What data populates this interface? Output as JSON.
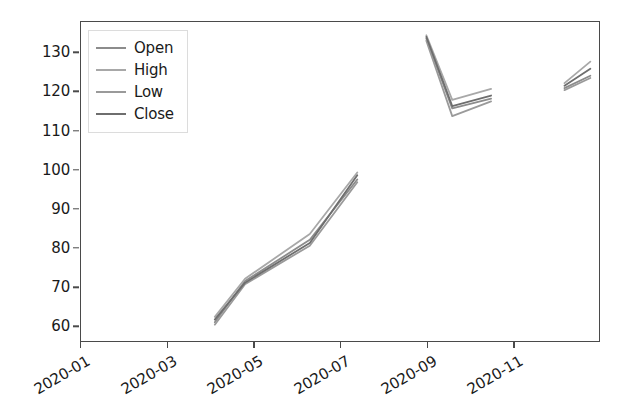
{
  "chart_data": {
    "type": "line",
    "title": "",
    "xlabel": "",
    "ylabel": "",
    "xlim": [
      "2020-01",
      "2020-13"
    ],
    "ylim": [
      56,
      138
    ],
    "grid": false,
    "legend_position": "upper left",
    "y_ticks": [
      60,
      70,
      80,
      90,
      100,
      110,
      120,
      130
    ],
    "x_ticks": [
      "2020-01",
      "2020-03",
      "2020-05",
      "2020-07",
      "2020-09",
      "2020-11"
    ],
    "x_tick_rotation": -30,
    "colors": {
      "open": "#8c8c8c",
      "high": "#a8a8a8",
      "low": "#9a9a9a",
      "close": "#6e6e6e",
      "axis": "#4a4a4a",
      "text": "#1a1a1a",
      "background": "#ffffff"
    },
    "legend": [
      {
        "label": "Open",
        "color": "#8c8c8c"
      },
      {
        "label": "High",
        "color": "#a8a8a8"
      },
      {
        "label": "Low",
        "color": "#9a9a9a"
      },
      {
        "label": "Close",
        "color": "#6e6e6e"
      }
    ],
    "series": [
      {
        "name": "Open",
        "color": "#8c8c8c",
        "segments": [
          {
            "x": [
              "2020-04.1",
              "2020-04.8",
              "2020-06.3",
              "2020-07.4"
            ],
            "y": [
              60.8,
              71.4,
              82.0,
              97.5
            ]
          },
          {
            "x": [
              "2020-09.0",
              "2020-09.6",
              "2020-10.5"
            ],
            "y": [
              133.8,
              115.8,
              118.3
            ]
          },
          {
            "x": [
              "2020-12.2",
              "2020-12.8"
            ],
            "y": [
              121.0,
              124.2
            ]
          }
        ]
      },
      {
        "name": "High",
        "color": "#a8a8a8",
        "segments": [
          {
            "x": [
              "2020-04.1",
              "2020-04.8",
              "2020-06.3",
              "2020-07.4"
            ],
            "y": [
              62.2,
              72.0,
              83.5,
              99.3
            ]
          },
          {
            "x": [
              "2020-09.0",
              "2020-09.6",
              "2020-10.5"
            ],
            "y": [
              134.6,
              118.0,
              120.8
            ]
          },
          {
            "x": [
              "2020-12.2",
              "2020-12.8"
            ],
            "y": [
              122.3,
              127.8
            ]
          }
        ]
      },
      {
        "name": "Low",
        "color": "#9a9a9a",
        "segments": [
          {
            "x": [
              "2020-04.1",
              "2020-04.8",
              "2020-06.3",
              "2020-07.4"
            ],
            "y": [
              60.2,
              70.6,
              80.5,
              96.8
            ]
          },
          {
            "x": [
              "2020-09.0",
              "2020-09.6",
              "2020-10.5"
            ],
            "y": [
              133.2,
              113.8,
              117.6
            ]
          },
          {
            "x": [
              "2020-12.2",
              "2020-12.8"
            ],
            "y": [
              120.5,
              123.6
            ]
          }
        ]
      },
      {
        "name": "Close",
        "color": "#6e6e6e",
        "segments": [
          {
            "x": [
              "2020-04.1",
              "2020-04.8",
              "2020-06.3",
              "2020-07.4"
            ],
            "y": [
              61.5,
              71.0,
              81.2,
              98.6
            ]
          },
          {
            "x": [
              "2020-09.0",
              "2020-09.6",
              "2020-10.5"
            ],
            "y": [
              134.2,
              116.4,
              119.1
            ]
          },
          {
            "x": [
              "2020-12.2",
              "2020-12.8"
            ],
            "y": [
              121.6,
              126.0
            ]
          }
        ]
      }
    ]
  }
}
